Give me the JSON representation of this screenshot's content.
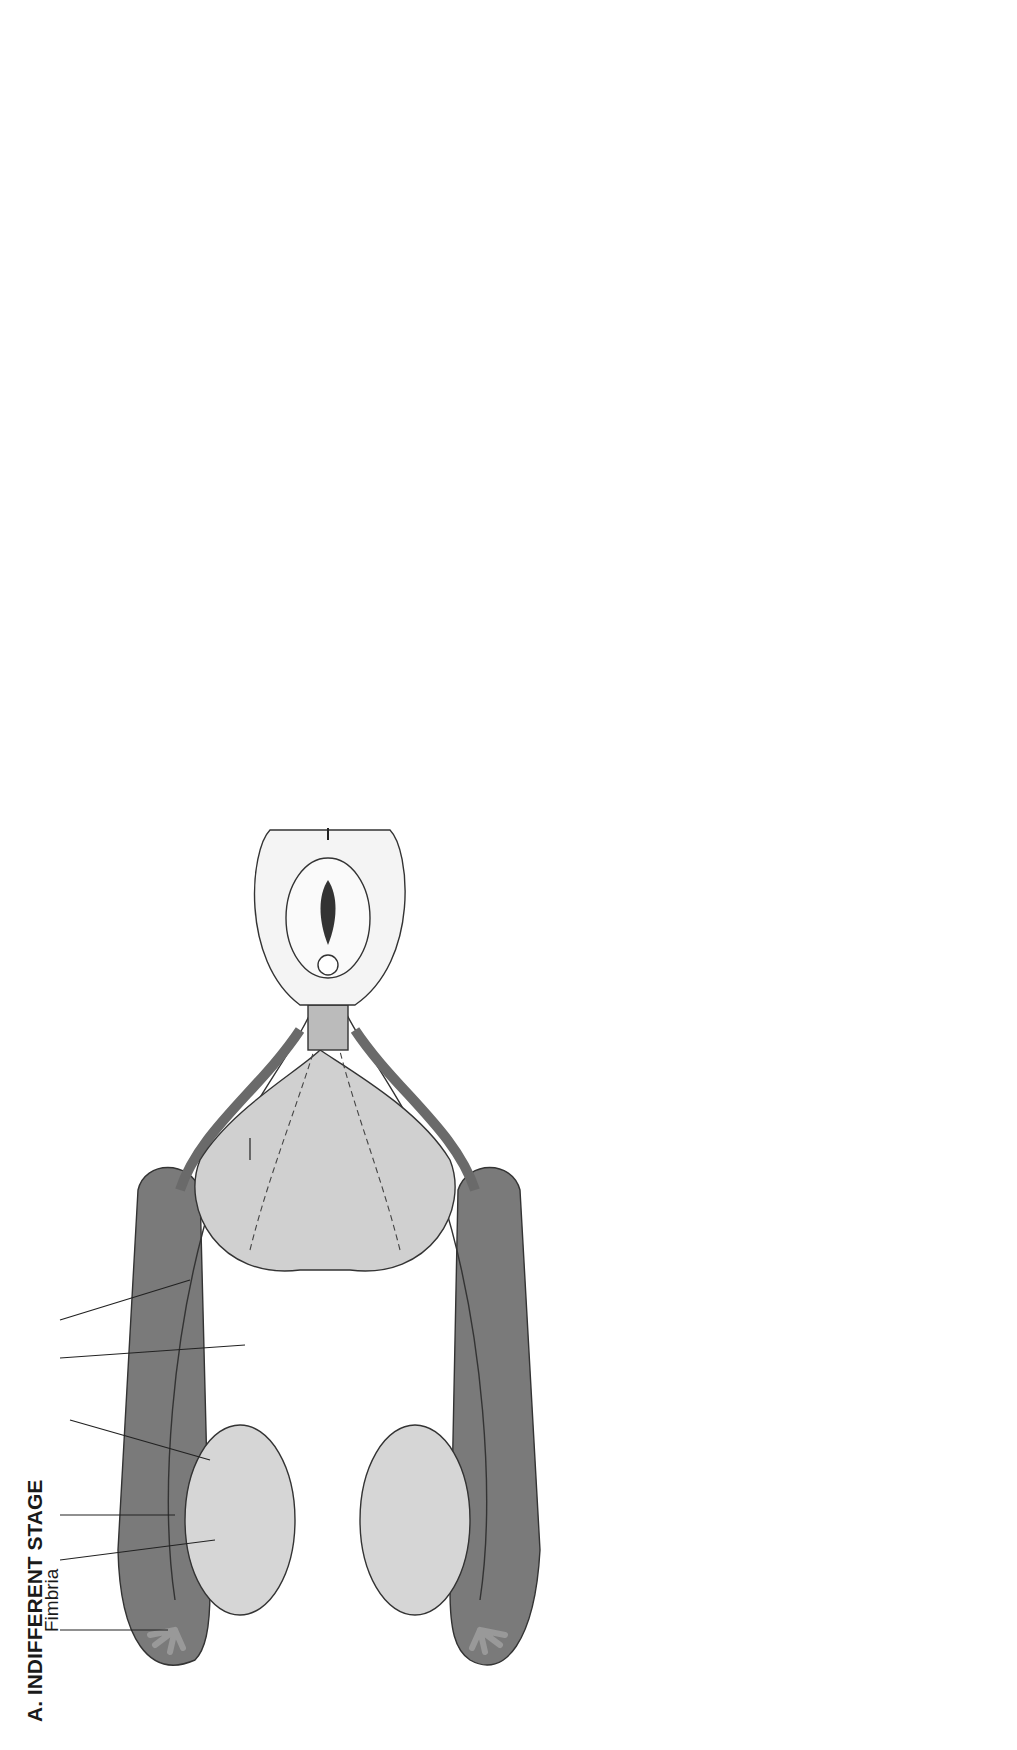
{
  "panels": {
    "indifferent": {
      "title": "A.  INDIFFERENT STAGE",
      "labels": {
        "fimbria": "Fimbria",
        "gonad": "Gonad",
        "mullerian_duct_1": "Müllerian",
        "mullerian_duct_2": "duct",
        "genital_ligament_1": "Genital",
        "genital_ligament_2": "ligament",
        "mesonephoros": "Mesonephoros",
        "wolffian_duct": "Wolffian duct",
        "bladder": "Bladder",
        "uterovaginal_canal": "Uterovaginal canal",
        "urogenital_sinus": "Urogenital sinus",
        "urethral_fold": "Urethral fold",
        "urogenital_slit": "Urogenital slit",
        "genital_tubercle": "Genital tubercle",
        "labioscrotal_swelling_1": "Labioscrotal",
        "labioscrotal_swelling_2": "swelling",
        "anus": "Anus"
      }
    },
    "female": {
      "title": "B.  FEMALE DEVELOPMENT",
      "labels": {
        "hydatid": "Hydatid",
        "ovary": "Ovary",
        "ovarian_ligament_1": "Ovarian",
        "ovarian_ligament_2": "ligament",
        "uterine_tube": "Uterine tube",
        "epoophoron": "Epoophoron",
        "paroophoron": "Paroophoron",
        "round_ligament": "Round ligament",
        "gartners_duct": "Gartner's duct",
        "clitoris": "Clitoris",
        "urethral_meatus": "Urethral meatus",
        "vaginal_orifice": "Vaginal orifice",
        "vestibular_glands_1": "Vestibular glands",
        "vestibular_glands_2": "(Bartholin)"
      }
    },
    "male": {
      "title": "C.  MALE DEVELOPMENT",
      "labels": {
        "hydatid_1": "Hydatid",
        "hydatid_2": "(appendix testis)",
        "testis": "Testis",
        "gubernaculum_upper": "Gubernaculum",
        "vas_deferens": "Vas deferens",
        "efferent_ductules_1": "Efferent",
        "efferent_ductules_2": "ductules",
        "epididymis": "Epididymis",
        "aberrant_ductule_1": "Aberrant",
        "aberrant_ductule_2": "ductule",
        "bladder": "Bladder",
        "seminal_vesicle": "Seminal vesicle",
        "membranous_urethra": "Membranous urethra",
        "cavernous_urethra": "Cavernous urethra",
        "vaginal_rudiment_1": "Vaginal rudiment",
        "vaginal_rudiment_2": "(prostatic utricle)",
        "prostate": "Prostate",
        "gubernaculum_lower": "Gubernaculum"
      }
    }
  },
  "sagittal": {
    "stage_23mm": {
      "size": "23 mm",
      "labels": {
        "gonad": "Gonad",
        "mesonephros": "Mesonephros",
        "wolffian_duct": "Wolffian duct",
        "mullerian_duct": "Müllerian duct",
        "urogenital_sinus": "Urogenital sinus",
        "ureter": "Ureter",
        "genital_tubercle": "Genital tubercle"
      }
    },
    "stage_63mm": {
      "size": "63 mm",
      "labels": {
        "ovary": "Ovary",
        "epoophoron": "Epoophoron",
        "paroophoron": "Paroophoron",
        "gartners_duct_1": "Gartner's",
        "gartners_duct_2": "duct",
        "urogenital_sinus_1": "Urogenital",
        "urogenital_sinus_2": "sinus"
      }
    },
    "stage_162mm": {
      "size": "162 mm",
      "labels": {
        "ovary": "Ovary",
        "epoophoron": "Epoophoron",
        "paroophoron": "Paroophoron",
        "bartholins_gland_1": "Bartholin's",
        "bartholins_gland_2": "gland",
        "skenes_gland_1": "Skene's",
        "skenes_gland_2": "gland"
      }
    },
    "male_adult": {
      "labels": {
        "appendix_testis": "Appendix testis",
        "testis": "Testis",
        "wolffian_duct": "Wolffian duct",
        "seminal_vesicle": "Seminal vesicle",
        "bulbourethral_gland": "Bulbourethral gland",
        "prostatic_utricle_1": "Prostatic",
        "prostatic_utricle_2": "utricle",
        "prostate": "Prostate"
      }
    }
  },
  "page_number": "404",
  "colors": {
    "dark_tissue": "#6e6e6e",
    "mid_tissue": "#a8a8a8",
    "light_tissue": "#d4d4d4",
    "ink": "#1a1a1a",
    "background": "#ffffff"
  }
}
